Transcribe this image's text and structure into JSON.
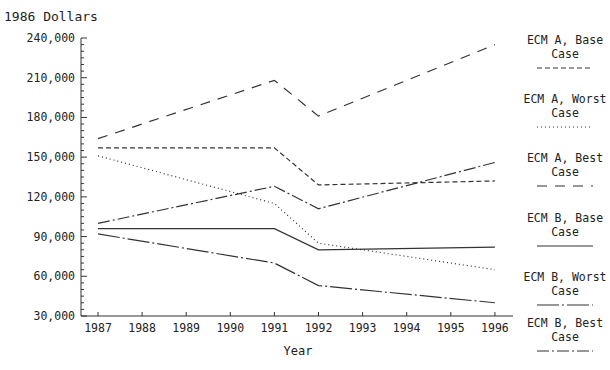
{
  "chart_data": {
    "type": "line",
    "title": "",
    "ylabel": "1986 Dollars",
    "xlabel": "Year",
    "x": [
      1987,
      1991,
      1992,
      1996
    ],
    "x_ticks": [
      "1987",
      "1988",
      "1989",
      "1990",
      "1991",
      "1992",
      "1993",
      "1994",
      "1995",
      "1996"
    ],
    "y_ticks": [
      "30,000",
      "60,000",
      "90,000",
      "120,000",
      "150,000",
      "180,000",
      "210,000",
      "240,000"
    ],
    "ylim": [
      30000,
      240000
    ],
    "grid": false,
    "legend_position": "right",
    "series": [
      {
        "name": "ECM A, Base Case",
        "style": "short-dash",
        "values": [
          157000,
          157000,
          129000,
          132000
        ]
      },
      {
        "name": "ECM A, Worst Case",
        "style": "dotted",
        "values": [
          151000,
          115000,
          85000,
          65000
        ]
      },
      {
        "name": "ECM A, Best Case",
        "style": "long-dash",
        "values": [
          164000,
          208000,
          181000,
          235000
        ]
      },
      {
        "name": "ECM B, Base Case",
        "style": "solid",
        "values": [
          96000,
          96000,
          80000,
          82000
        ]
      },
      {
        "name": "ECM B, Worst Case",
        "style": "long-dash-dot",
        "values": [
          92000,
          70000,
          53000,
          40000
        ]
      },
      {
        "name": "ECM B, Best Case",
        "style": "dash-dash-dot",
        "values": [
          100000,
          128000,
          111000,
          146000
        ]
      }
    ]
  },
  "legend": [
    {
      "line1": "ECM A, Base",
      "line2": "Case"
    },
    {
      "line1": "ECM A, Worst",
      "line2": "Case"
    },
    {
      "line1": "ECM A, Best",
      "line2": "Case"
    },
    {
      "line1": "ECM B, Base",
      "line2": "Case"
    },
    {
      "line1": "ECM B, Worst",
      "line2": "Case"
    },
    {
      "line1": "ECM B, Best",
      "line2": "Case"
    }
  ],
  "labels": {
    "y_title": "1986 Dollars",
    "x_title": "Year"
  }
}
